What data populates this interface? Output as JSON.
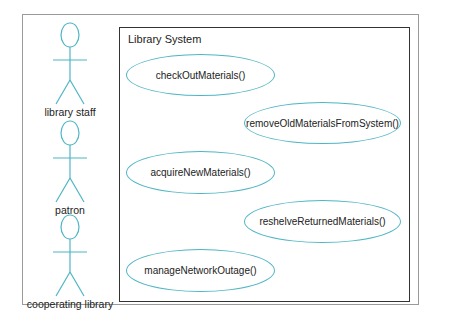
{
  "diagram": {
    "type": "UML use case diagram",
    "system": {
      "title": "Library System"
    },
    "actors": [
      {
        "label": "library staff"
      },
      {
        "label": "patron"
      },
      {
        "label": "cooperating library"
      }
    ],
    "use_cases": [
      {
        "label": "checkOutMaterials()"
      },
      {
        "label": "removeOldMaterialsFromSystem()"
      },
      {
        "label": "acquireNewMaterials()"
      },
      {
        "label": "reshelveReturnedMaterials()"
      },
      {
        "label": "manageNetworkOutage()"
      }
    ],
    "colors": {
      "actor_stroke": "#4fb5c4",
      "usecase_stroke": "#4fb5c4",
      "system_border": "#333333",
      "frame_border": "#9a9a9a"
    }
  }
}
